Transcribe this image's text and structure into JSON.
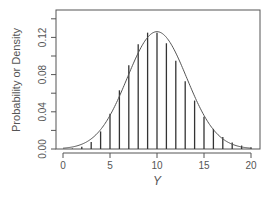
{
  "chart_data": {
    "type": "bar",
    "subtype": "pmf-spikes-with-density-curve",
    "title": "",
    "xlabel": "Y",
    "ylabel": "Probability or Density",
    "xlim": [
      0,
      20
    ],
    "ylim": [
      0,
      0.14
    ],
    "x_ticks": [
      "0",
      "5",
      "10",
      "15",
      "20"
    ],
    "y_ticks": [
      "0.00",
      "0.04",
      "0.08",
      "0.12"
    ],
    "y_minor_ticks": [
      0.02,
      0.06,
      0.1,
      0.14
    ],
    "grid": false,
    "legend": null,
    "series": [
      {
        "name": "Poisson(10) probabilities",
        "type": "spike",
        "x": [
          0,
          1,
          2,
          3,
          4,
          5,
          6,
          7,
          8,
          9,
          10,
          11,
          12,
          13,
          14,
          15,
          16,
          17,
          18,
          19,
          20
        ],
        "values": [
          0.0,
          0.0005,
          0.0023,
          0.0076,
          0.0189,
          0.0378,
          0.0631,
          0.0901,
          0.1126,
          0.1251,
          0.1251,
          0.1137,
          0.0948,
          0.0729,
          0.0521,
          0.0347,
          0.0217,
          0.0128,
          0.0071,
          0.0037,
          0.0019
        ]
      },
      {
        "name": "Normal density (mean 10, sd 3.16)",
        "type": "line",
        "mean": 10,
        "sd": 3.162,
        "peak": 0.126
      }
    ],
    "colors": {
      "axis": "#555555",
      "spike": "#333333",
      "curve": "#555555"
    }
  },
  "axes": {
    "xlabel": "Y",
    "ylabel": "Probability or Density"
  }
}
